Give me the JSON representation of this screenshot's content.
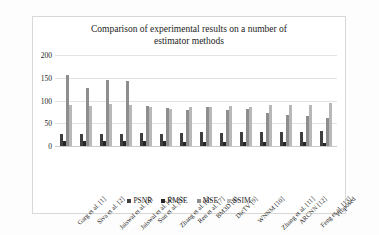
{
  "chart": {
    "title": "Comparison of experimental results on a number of estimator methods",
    "title_line1": "Comparison of experimental results on a number of",
    "title_line2": "estimator methods"
  },
  "chart_data": {
    "type": "bar",
    "title": "Comparison of experimental results on a number of estimator methods",
    "xlabel": "",
    "ylabel": "",
    "ylim": [
      0,
      200
    ],
    "yticks": [
      0,
      50,
      100,
      150,
      200
    ],
    "grid": true,
    "legend_position": "bottom",
    "categories": [
      "Garg et al. [1]",
      "Siva et al. [2]",
      "Jaiswal et al. [3]",
      "Jaiswal et al. [4]",
      "Sun et al. [5]",
      "Zhang et al. [6]",
      "Ren et al. [7]",
      "BM3D [8]",
      "DicTV [9]",
      "WNNM [10]",
      "Zhang et al. [11]",
      "ARCNN [12]",
      "Feng et al. [13]",
      "Proposed"
    ],
    "series": [
      {
        "name": "PSNR",
        "color": "#3f3f3f",
        "values": [
          26,
          27,
          26,
          27,
          28,
          27,
          29,
          30,
          29,
          30,
          30,
          31,
          31,
          32
        ]
      },
      {
        "name": "RMSE",
        "color": "#272727",
        "values": [
          12,
          11,
          11,
          11,
          10,
          10,
          9,
          9,
          9,
          9,
          8,
          8,
          8,
          7
        ]
      },
      {
        "name": "MSE",
        "color": "#8e8e8e",
        "values": [
          157,
          128,
          146,
          142,
          87,
          83,
          79,
          86,
          80,
          81,
          73,
          69,
          65,
          62
        ]
      },
      {
        "name": "SSIM",
        "color": "#b8b8b8",
        "values": [
          90,
          89,
          92,
          91,
          86,
          82,
          85,
          85,
          89,
          86,
          90,
          90,
          91,
          94
        ]
      }
    ]
  },
  "legend": {
    "items": [
      {
        "label": "PSNR",
        "color": "#3f3f3f"
      },
      {
        "label": "RMSE",
        "color": "#272727"
      },
      {
        "label": "MSE",
        "color": "#8e8e8e"
      },
      {
        "label": "SSIM",
        "color": "#b8b8b8"
      }
    ]
  }
}
